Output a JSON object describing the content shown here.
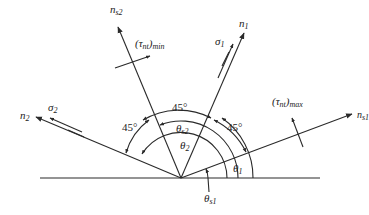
{
  "figure": {
    "type": "stress transformation angle diagram",
    "axes": {
      "n_s2": {
        "name": "n",
        "sub": "s2"
      },
      "n_1": {
        "name": "n",
        "sub": "1"
      },
      "n_2": {
        "name": "n",
        "sub": "2"
      },
      "n_s1": {
        "name": "n",
        "sub": "s1"
      }
    },
    "stresses": {
      "sigma_1": {
        "name": "σ",
        "sub": "1"
      },
      "sigma_2": {
        "name": "σ",
        "sub": "2"
      },
      "tau_min": {
        "name": "(τ",
        "sub_inner": "nt",
        "close": ")",
        "sub": "min"
      },
      "tau_max": {
        "name": "(τ",
        "sub_inner": "nt",
        "close": ")",
        "sub": "max"
      }
    },
    "angles": {
      "deg_top": "45°",
      "deg_left": "45°",
      "deg_right": "45°",
      "theta_s2": {
        "name": "θ",
        "sub": "s2"
      },
      "theta_2": {
        "name": "θ",
        "sub": "2"
      },
      "theta_1": {
        "name": "θ",
        "sub": "1"
      },
      "theta_s1": {
        "name": "θ",
        "sub": "s1"
      }
    },
    "colors": {
      "line": "#2a2a2a",
      "text": "#222222",
      "background": "#ffffff"
    }
  }
}
